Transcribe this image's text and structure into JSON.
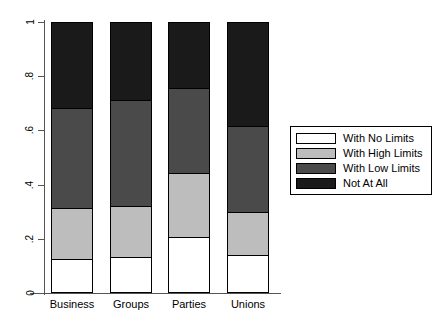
{
  "chart_data": {
    "type": "bar",
    "stacked": true,
    "title": "",
    "xlabel": "",
    "ylabel": "",
    "ylim": [
      0,
      1
    ],
    "ytick_labels": [
      "0",
      ".2",
      ".4",
      ".6",
      ".8",
      "1"
    ],
    "ytick_values": [
      0,
      0.2,
      0.4,
      0.6,
      0.8,
      1
    ],
    "grid": false,
    "legend_position": "right",
    "categories": [
      "Business",
      "Groups",
      "Parties",
      "Unions"
    ],
    "series": [
      {
        "name": "With No Limits",
        "color": "#ffffff",
        "values": [
          0.12,
          0.125,
          0.2,
          0.135
        ]
      },
      {
        "name": "With High Limits",
        "color": "#bdbdbd",
        "values": [
          0.19,
          0.19,
          0.24,
          0.16
        ]
      },
      {
        "name": "With Low Limits",
        "color": "#4a4a4a",
        "values": [
          0.37,
          0.395,
          0.315,
          0.32
        ]
      },
      {
        "name": "Not At All",
        "color": "#1a1a1a",
        "values": [
          0.32,
          0.29,
          0.245,
          0.385
        ]
      }
    ]
  },
  "axes": {
    "y_ticks": [
      {
        "label": "1",
        "value": 1
      },
      {
        "label": ".8",
        "value": 0.8
      },
      {
        "label": ".6",
        "value": 0.6
      },
      {
        "label": ".4",
        "value": 0.4
      },
      {
        "label": ".2",
        "value": 0.2
      },
      {
        "label": "0",
        "value": 0
      }
    ],
    "x_labels": [
      "Business",
      "Groups",
      "Parties",
      "Unions"
    ]
  },
  "legend": {
    "items": [
      {
        "label": "With No Limits",
        "color": "#ffffff"
      },
      {
        "label": "With High Limits",
        "color": "#bdbdbd"
      },
      {
        "label": "With Low Limits",
        "color": "#4a4a4a"
      },
      {
        "label": "Not At All",
        "color": "#1a1a1a"
      }
    ]
  }
}
